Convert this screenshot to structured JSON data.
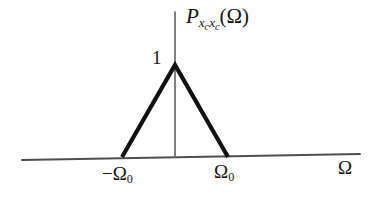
{
  "figure": {
    "background_color": "#ffffff",
    "ink_color": "#1a1a1a",
    "axis_color": "#5a5a5a",
    "curve_color": "#111111"
  },
  "labels": {
    "y_axis_function": {
      "base": "P",
      "subscript_1_var": "x",
      "subscript_1_sub": "c",
      "subscript_2_var": "x",
      "subscript_2_sub": "c",
      "open_paren": "(",
      "argument": "Ω",
      "close_paren": ")"
    },
    "peak_value": "1",
    "tick_negative": {
      "sign": "−",
      "symbol": "Ω",
      "subscript": "0"
    },
    "tick_positive": {
      "symbol": "Ω",
      "subscript": "0"
    },
    "x_axis_symbol": "Ω"
  },
  "chart_data": {
    "type": "line",
    "title": "",
    "subtitle": "",
    "xlabel": "Ω",
    "ylabel": "P_{x_c x_c}(Ω)",
    "grid": false,
    "legend": "none",
    "x": [
      -1.0,
      0.0,
      1.0
    ],
    "values": [
      0,
      1,
      0
    ],
    "series": [
      {
        "name": "P_{x_c x_c}(Ω)",
        "x": [
          -1.0,
          0.0,
          1.0
        ],
        "values": [
          0,
          1,
          0
        ]
      }
    ],
    "xlim": [
      -2.9,
      3.5
    ],
    "ylim": [
      0,
      1.6
    ],
    "xtick_values": [
      -1.0,
      1.0
    ],
    "xtick_labels": [
      "−Ω₀",
      "Ω₀"
    ],
    "ytick_values": [
      1.0
    ],
    "ytick_labels": [
      "1"
    ],
    "annotations": [
      {
        "text": "1",
        "x": 0.0,
        "y": 1.0,
        "note": "peak amplitude at Ω = 0"
      },
      {
        "text": "−Ω₀",
        "x": -1.0,
        "y": 0,
        "note": "left zero crossing"
      },
      {
        "text": "Ω₀",
        "x": 1.0,
        "y": 0,
        "note": "right zero crossing"
      }
    ]
  },
  "geometry": {
    "apex": {
      "x": 175,
      "y": 65
    },
    "left_foot": {
      "x": 122,
      "y": 157
    },
    "right_foot": {
      "x": 228,
      "y": 157
    },
    "x_axis_start": {
      "x": 22,
      "y": 160
    },
    "x_axis_end": {
      "x": 360,
      "y": 154
    },
    "y_axis_top": {
      "x": 175,
      "y": 12
    },
    "y_axis_bottom": {
      "x": 175,
      "y": 157
    }
  }
}
